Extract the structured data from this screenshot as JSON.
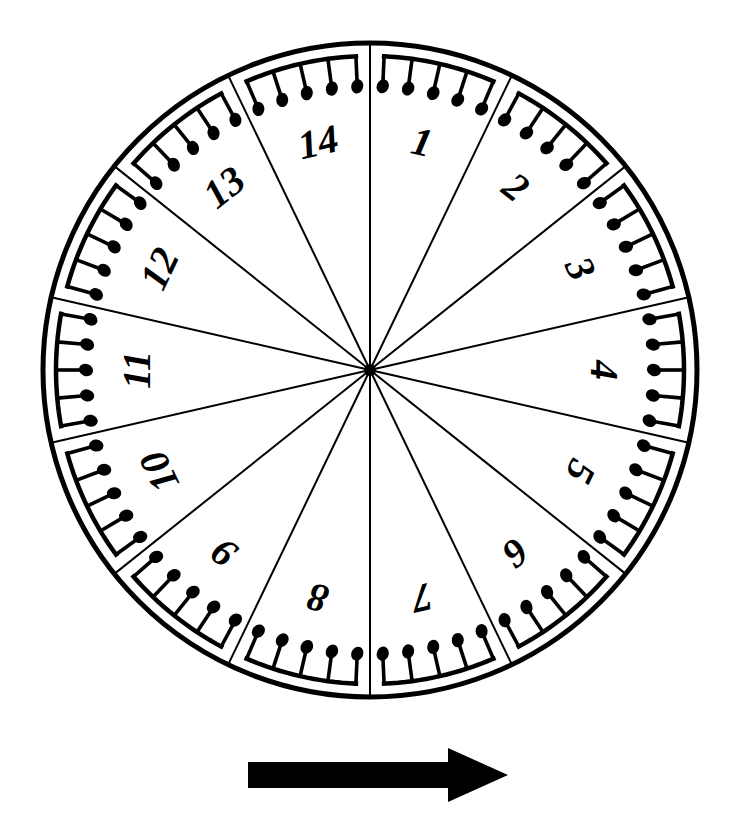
{
  "figure": {
    "background_color": "#ffffff",
    "ink_color": "#000000"
  },
  "wheel": {
    "center_x": 370,
    "center_y": 370,
    "radius": 327,
    "rim_stroke_width": 5,
    "spoke_stroke_width": 2,
    "sector_count": 14,
    "start_angle_deg": -90,
    "hub_radius": 6,
    "notes_per_sector": 5,
    "note_symbol": "beamed-eighth-notes",
    "sectors": [
      {
        "label": "1",
        "index": 1,
        "notes": 5
      },
      {
        "label": "2",
        "index": 2,
        "notes": 5
      },
      {
        "label": "3",
        "index": 3,
        "notes": 5
      },
      {
        "label": "4",
        "index": 4,
        "notes": 5
      },
      {
        "label": "5",
        "index": 5,
        "notes": 5
      },
      {
        "label": "6",
        "index": 6,
        "notes": 5
      },
      {
        "label": "7",
        "index": 7,
        "notes": 5
      },
      {
        "label": "8",
        "index": 8,
        "notes": 5
      },
      {
        "label": "9",
        "index": 9,
        "notes": 5
      },
      {
        "label": "10",
        "index": 10,
        "notes": 5
      },
      {
        "label": "11",
        "index": 11,
        "notes": 5
      },
      {
        "label": "12",
        "index": 12,
        "notes": 5
      },
      {
        "label": "13",
        "index": 13,
        "notes": 5
      },
      {
        "label": "14",
        "index": 14,
        "notes": 5
      }
    ]
  },
  "arrow": {
    "name": "direction-arrow",
    "direction": "right",
    "x": 248,
    "y": 748,
    "shaft_length": 200,
    "shaft_height": 26,
    "head_length": 60,
    "head_height": 54,
    "color": "#000000"
  }
}
